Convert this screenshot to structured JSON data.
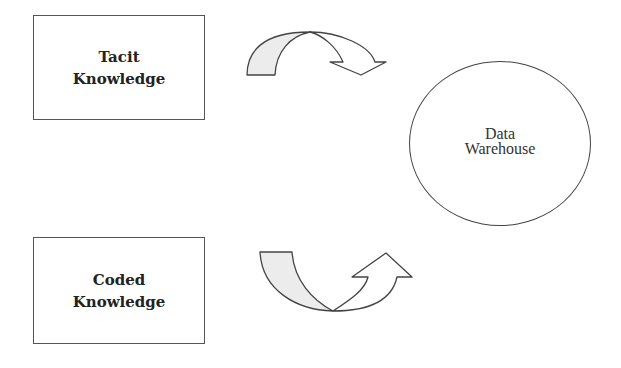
{
  "diagram": {
    "nodes": {
      "tacit": {
        "line1": "Tacit",
        "line2": "Knowledge",
        "shape": "rectangle"
      },
      "coded": {
        "line1": "Coded",
        "line2": "Knowledge",
        "shape": "rectangle"
      },
      "warehouse": {
        "line1": "Data",
        "line2": "Warehouse",
        "shape": "ellipse"
      }
    },
    "arrows": [
      {
        "id": "upper",
        "shape": "curved-arrow-over-down",
        "from": "tacit",
        "toward": "warehouse"
      },
      {
        "id": "lower",
        "shape": "curved-arrow-under-up",
        "from": "coded",
        "toward": "warehouse"
      }
    ],
    "colors": {
      "stroke": "#444444",
      "arrow_fill_light": "#e8e8e8",
      "arrow_fill_white": "#ffffff",
      "background": "#ffffff"
    }
  }
}
